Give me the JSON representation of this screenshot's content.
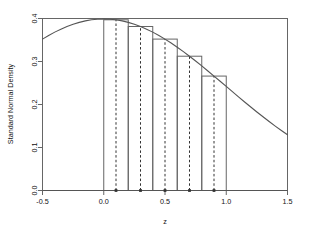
{
  "chart_data": {
    "type": "area",
    "title": "",
    "xlabel": "z",
    "ylabel": "Standard Normal Density",
    "xlim": [
      -0.5,
      1.5
    ],
    "ylim": [
      0.0,
      0.4
    ],
    "grid": false,
    "legend": "none",
    "x_ticks": [
      -0.5,
      0.0,
      0.5,
      1.0,
      1.5
    ],
    "x_tick_labels": [
      "-0.5",
      "0.0",
      "0.5",
      "1.0",
      "1.5"
    ],
    "y_ticks": [
      0.0,
      0.1,
      0.2,
      0.3,
      0.4
    ],
    "y_tick_labels": [
      "0.0",
      "0.1",
      "0.2",
      "0.3",
      "0.4"
    ],
    "curve": {
      "name": "standard normal density",
      "x": [
        -0.5,
        -0.45,
        -0.4,
        -0.35,
        -0.3,
        -0.25,
        -0.2,
        -0.15,
        -0.1,
        -0.05,
        0.0,
        0.05,
        0.1,
        0.15,
        0.2,
        0.25,
        0.3,
        0.35,
        0.4,
        0.45,
        0.5,
        0.55,
        0.6,
        0.65,
        0.7,
        0.75,
        0.8,
        0.85,
        0.9,
        0.95,
        1.0,
        1.05,
        1.1,
        1.15,
        1.2,
        1.25,
        1.3,
        1.35,
        1.4,
        1.45,
        1.5
      ],
      "y": [
        0.3521,
        0.3605,
        0.3683,
        0.3752,
        0.3814,
        0.3867,
        0.391,
        0.3945,
        0.397,
        0.3984,
        0.3989,
        0.3984,
        0.397,
        0.3945,
        0.391,
        0.3867,
        0.3814,
        0.3752,
        0.3683,
        0.3605,
        0.3521,
        0.3429,
        0.3332,
        0.323,
        0.3123,
        0.3011,
        0.2897,
        0.278,
        0.2661,
        0.2541,
        0.242,
        0.2299,
        0.2179,
        0.2059,
        0.1942,
        0.1826,
        0.1714,
        0.1604,
        0.1497,
        0.1394,
        0.1295
      ]
    },
    "rectangles": {
      "name": "midpoint Riemann sum rectangles",
      "edges": [
        0.0,
        0.2,
        0.4,
        0.6,
        0.8,
        1.0
      ],
      "midpoints": [
        0.1,
        0.3,
        0.5,
        0.7,
        0.9
      ],
      "heights": [
        0.397,
        0.3814,
        0.3521,
        0.3123,
        0.2661
      ],
      "width": 0.2
    },
    "midpoint_markers": {
      "x": [
        0.1,
        0.3,
        0.5,
        0.7,
        0.9
      ],
      "y": [
        0,
        0,
        0,
        0,
        0
      ]
    },
    "colors": {
      "curve": "#555555",
      "rect_border": "#666666",
      "midpoint_dashed": "#333333",
      "axis": "#666666",
      "text": "#111111",
      "background": "#ffffff"
    }
  }
}
